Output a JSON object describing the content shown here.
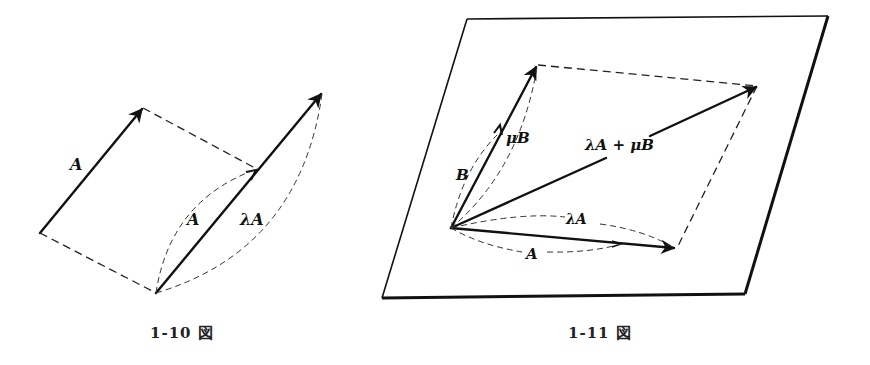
{
  "figures": [
    {
      "id": "fig-1-10",
      "caption": "1-10 図",
      "labels": {
        "vector_a": "A",
        "inner_a": "A",
        "lambda_a": "λA"
      }
    },
    {
      "id": "fig-1-11",
      "caption": "1-11 図",
      "labels": {
        "b": "B",
        "mu_b": "μB",
        "sum": "λA + μB",
        "lambda_a": "λA",
        "a": "A"
      }
    }
  ]
}
